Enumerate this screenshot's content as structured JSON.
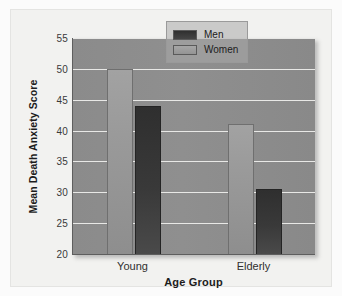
{
  "chart_data": {
    "type": "bar",
    "title": "",
    "xlabel": "Age Group",
    "ylabel": "Mean Death Anxiety Score",
    "categories": [
      "Young",
      "Elderly"
    ],
    "series": [
      {
        "name": "Men",
        "values": [
          44,
          30.5
        ],
        "color": "#393939"
      },
      {
        "name": "Women",
        "values": [
          50,
          41
        ],
        "color": "#9a9a9a"
      }
    ],
    "bar_order_in_group": [
      "Women",
      "Men"
    ],
    "ylim": [
      20,
      55
    ],
    "yticks": [
      20,
      25,
      30,
      35,
      40,
      45,
      50,
      55
    ],
    "ytick_labels": [
      "20",
      "25",
      "30",
      "35",
      "40",
      "45",
      "50",
      "55"
    ],
    "grid": true,
    "grid_axis": "y",
    "legend_position": "top-right",
    "panel_color": "#8e8e8e",
    "gridline_color": "#e8e8e6",
    "page_background": "#fbfbfb"
  },
  "legend": {
    "entries": [
      {
        "label": "Men"
      },
      {
        "label": "Women"
      }
    ]
  }
}
